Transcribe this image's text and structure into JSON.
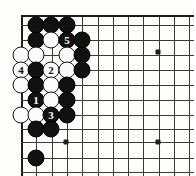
{
  "figure": {
    "kind": "go-board-diagram",
    "title": "",
    "board_region": "upper-left corner of a Go board",
    "colors": {
      "board_background": "#fefefd",
      "grid_line": "#3a3a3a",
      "edge_line": "#1d1d1d",
      "black_stone": "#111111",
      "white_stone": "#fbfbfb",
      "black_stone_label": "#ffffff",
      "white_stone_label": "#111111"
    }
  },
  "board": {
    "origin_x": 21,
    "origin_y": 15,
    "spacing": 15.3,
    "cols": 12,
    "rows": 11,
    "left_edge": true,
    "top_edge": true,
    "bottom_edge": false,
    "right_edge": false
  },
  "star_points": [
    {
      "x": 158,
      "y": 52
    },
    {
      "x": 66,
      "y": 142
    },
    {
      "x": 158,
      "y": 142
    }
  ],
  "stones": [
    {
      "color": "black",
      "x": 36,
      "y": 25,
      "label": ""
    },
    {
      "color": "black",
      "x": 51,
      "y": 25,
      "label": ""
    },
    {
      "color": "black",
      "x": 67,
      "y": 25,
      "label": ""
    },
    {
      "color": "black",
      "x": 36,
      "y": 40,
      "label": ""
    },
    {
      "color": "white",
      "x": 51,
      "y": 40,
      "label": ""
    },
    {
      "color": "black",
      "x": 67,
      "y": 40,
      "label": "5"
    },
    {
      "color": "black",
      "x": 82,
      "y": 40,
      "label": ""
    },
    {
      "color": "white",
      "x": 21,
      "y": 55,
      "label": ""
    },
    {
      "color": "white",
      "x": 36,
      "y": 55,
      "label": ""
    },
    {
      "color": "white",
      "x": 67,
      "y": 55,
      "label": ""
    },
    {
      "color": "black",
      "x": 82,
      "y": 55,
      "label": ""
    },
    {
      "color": "white",
      "x": 21,
      "y": 70,
      "label": "4"
    },
    {
      "color": "black",
      "x": 36,
      "y": 70,
      "label": ""
    },
    {
      "color": "white",
      "x": 51,
      "y": 70,
      "label": "2"
    },
    {
      "color": "white",
      "x": 67,
      "y": 70,
      "label": ""
    },
    {
      "color": "black",
      "x": 82,
      "y": 70,
      "label": ""
    },
    {
      "color": "white",
      "x": 21,
      "y": 85,
      "label": ""
    },
    {
      "color": "black",
      "x": 36,
      "y": 85,
      "label": ""
    },
    {
      "color": "white",
      "x": 51,
      "y": 85,
      "label": ""
    },
    {
      "color": "black",
      "x": 67,
      "y": 85,
      "label": ""
    },
    {
      "color": "black",
      "x": 36,
      "y": 100,
      "label": "1"
    },
    {
      "color": "white",
      "x": 51,
      "y": 100,
      "label": ""
    },
    {
      "color": "black",
      "x": 67,
      "y": 100,
      "label": ""
    },
    {
      "color": "white",
      "x": 21,
      "y": 115,
      "label": ""
    },
    {
      "color": "white",
      "x": 36,
      "y": 115,
      "label": ""
    },
    {
      "color": "black",
      "x": 51,
      "y": 115,
      "label": "3"
    },
    {
      "color": "black",
      "x": 67,
      "y": 115,
      "label": ""
    },
    {
      "color": "black",
      "x": 36,
      "y": 129,
      "label": ""
    },
    {
      "color": "black",
      "x": 51,
      "y": 129,
      "label": ""
    },
    {
      "color": "black",
      "x": 36,
      "y": 158,
      "label": ""
    }
  ],
  "move_sequence": [
    {
      "number": "1",
      "color": "black"
    },
    {
      "number": "2",
      "color": "white"
    },
    {
      "number": "3",
      "color": "black"
    },
    {
      "number": "4",
      "color": "white"
    },
    {
      "number": "5",
      "color": "black"
    }
  ]
}
